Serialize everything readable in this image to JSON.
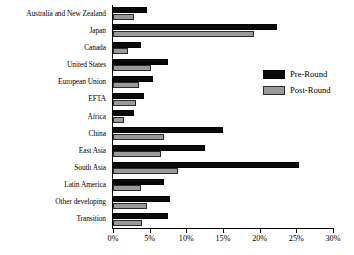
{
  "chart_data": {
    "type": "bar",
    "orientation": "horizontal",
    "title": "",
    "subtitle": "",
    "xlabel": "",
    "ylabel": "",
    "xlim": [
      0,
      30
    ],
    "xticks": [
      0,
      5,
      10,
      15,
      20,
      25,
      30
    ],
    "xtick_labels": [
      "0%",
      "5%",
      "10%",
      "15%",
      "20%",
      "25%",
      "30%"
    ],
    "grid": false,
    "legend_position": "right-upper",
    "categories": [
      "Australia and New Zealand",
      "Japan",
      "Canada",
      "United States",
      "European Union",
      "EFTA",
      "Africa",
      "China",
      "East Asia",
      "South Asia",
      "Latin America",
      "Other developing",
      "Transition"
    ],
    "series": [
      {
        "name": "Pre-Round",
        "color": "#0a0a0a",
        "values": [
          4.7,
          22.4,
          3.8,
          7.5,
          5.5,
          4.2,
          2.8,
          15.0,
          12.5,
          25.3,
          7.0,
          7.8,
          7.5
        ]
      },
      {
        "name": "Post-Round",
        "color": "#9a9a9a",
        "values": [
          2.8,
          19.2,
          2.0,
          5.2,
          3.6,
          3.1,
          1.5,
          7.0,
          6.5,
          8.8,
          3.8,
          4.7,
          4.0
        ]
      }
    ]
  },
  "legend": {
    "items": [
      {
        "label": "Pre-Round",
        "swatch": "pre"
      },
      {
        "label": "Post-Round",
        "swatch": "post"
      }
    ]
  }
}
